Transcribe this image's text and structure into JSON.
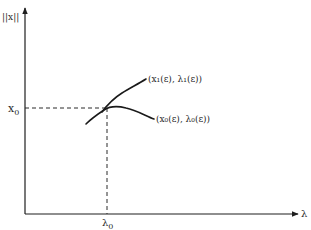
{
  "diagram": {
    "type": "bifurcation-diagram",
    "y_axis": {
      "label": "||x||"
    },
    "x_axis": {
      "label": "λ"
    },
    "reference_points": {
      "x0_label": "x",
      "x0_subscript": "0",
      "lambda0_label": "λ",
      "lambda0_subscript": "0"
    },
    "branches": [
      {
        "name": "upper-branch",
        "label": "(x₁(ε), λ₁(ε))"
      },
      {
        "name": "lower-branch",
        "label": "(x₀(ε), λ₀(ε))"
      }
    ],
    "colors": {
      "ink": "#1e1e1e",
      "background": "#ffffff"
    }
  }
}
